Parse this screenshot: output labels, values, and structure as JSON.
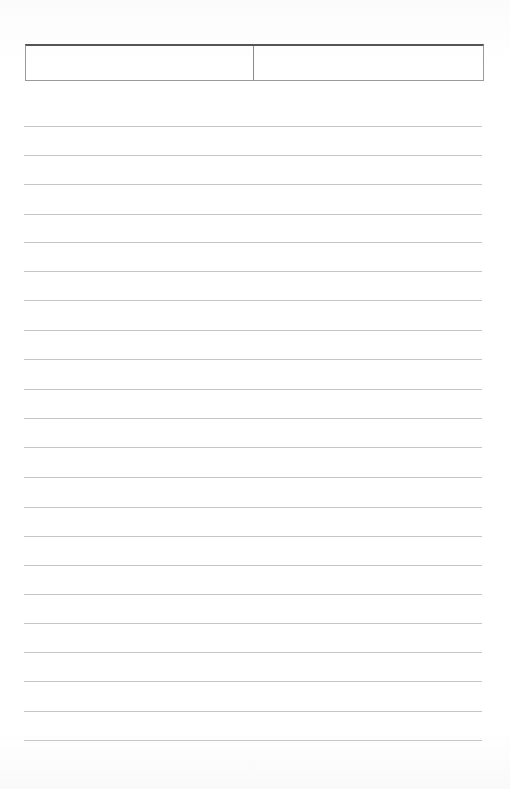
{
  "document": {
    "type": "blank ruled notebook page",
    "background_color": "#ffffff",
    "line_color": "#c6c6c6",
    "header_border_color": "#555555"
  },
  "header": {
    "left_field": "",
    "right_field": ""
  },
  "lines": [
    {
      "y": 126,
      "text": ""
    },
    {
      "y": 155,
      "text": ""
    },
    {
      "y": 184,
      "text": ""
    },
    {
      "y": 214,
      "text": ""
    },
    {
      "y": 242,
      "text": ""
    },
    {
      "y": 271,
      "text": ""
    },
    {
      "y": 300,
      "text": ""
    },
    {
      "y": 330,
      "text": ""
    },
    {
      "y": 359,
      "text": ""
    },
    {
      "y": 389,
      "text": ""
    },
    {
      "y": 418,
      "text": ""
    },
    {
      "y": 447,
      "text": ""
    },
    {
      "y": 477,
      "text": ""
    },
    {
      "y": 507,
      "text": ""
    },
    {
      "y": 536,
      "text": ""
    },
    {
      "y": 565,
      "text": ""
    },
    {
      "y": 594,
      "text": ""
    },
    {
      "y": 623,
      "text": ""
    },
    {
      "y": 652,
      "text": ""
    },
    {
      "y": 681,
      "text": ""
    },
    {
      "y": 711,
      "text": ""
    },
    {
      "y": 740,
      "text": ""
    }
  ]
}
